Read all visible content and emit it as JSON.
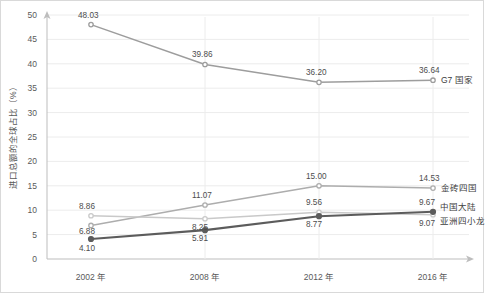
{
  "chart_data": {
    "type": "line",
    "title": "",
    "xlabel": "",
    "ylabel": "进口总额的全球占比（%）",
    "categories": [
      "2002 年",
      "2008 年",
      "2012 年",
      "2016 年"
    ],
    "ylim": [
      0,
      50
    ],
    "ytick_step": 5,
    "yticks": [
      "0",
      "5",
      "10",
      "15",
      "20",
      "25",
      "30",
      "35",
      "40",
      "45",
      "50"
    ],
    "grid": "horizontal-and-vertical",
    "legend_position": "right-inline-at-last-point",
    "series": [
      {
        "name": "G7 国家",
        "color": "#9d9d9d",
        "values": [
          48.03,
          39.86,
          36.2,
          36.64
        ],
        "labels": [
          "48.03",
          "39.86",
          "36.20",
          "36.64"
        ]
      },
      {
        "name": "金砖四国",
        "color": "#adadad",
        "values": [
          6.88,
          11.07,
          15.0,
          14.53
        ],
        "labels": [
          "6.88",
          "11.07",
          "15.00",
          "14.53"
        ]
      },
      {
        "name": "亚洲四小龙",
        "color": "#c9c9c9",
        "values": [
          8.86,
          8.25,
          9.56,
          9.07
        ],
        "labels": [
          "8.86",
          "8.25",
          "9.56",
          "9.07"
        ]
      },
      {
        "name": "中国大陆",
        "color": "#5c5c5c",
        "values": [
          4.1,
          5.91,
          8.77,
          9.67
        ],
        "labels": [
          "4.10",
          "5.91",
          "8.77",
          "9.67"
        ]
      }
    ]
  },
  "axes": {
    "y_axis_arrow": "up-arrow-icon",
    "x_axis_arrow": "right-arrow-icon"
  }
}
